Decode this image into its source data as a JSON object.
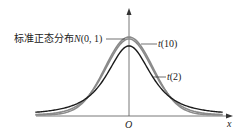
{
  "chart_data": {
    "type": "line",
    "title": "",
    "xlabel": "x",
    "ylabel": "",
    "origin_label": "O",
    "grid": false,
    "legend": "inline annotations",
    "series": [
      {
        "name": "标准正态分布N(0, 1)",
        "label_prefix": "标准正态分布",
        "label_math": "N",
        "label_args": "(0, 1)",
        "color": "#8a8a8a",
        "peak": 0.399,
        "df": null
      },
      {
        "name": "t(10)",
        "label_math": "t",
        "label_args": "(10)",
        "color": "#8a8a8a",
        "peak": 0.389,
        "df": 10
      },
      {
        "name": "t(2)",
        "label_math": "t",
        "label_args": "(2)",
        "color": "#1a1a1a",
        "peak": 0.354,
        "df": 2
      }
    ],
    "xlim": [
      -4,
      4
    ],
    "ylim": [
      0,
      0.45
    ]
  }
}
